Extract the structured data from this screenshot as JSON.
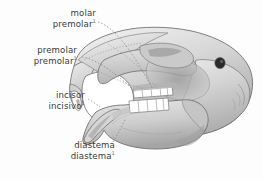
{
  "figure": {
    "background_color": "#fdfdfd",
    "text_color": "#3a3a3a",
    "leader_line_color": "#8a8a8a",
    "bone_fill_light": "#e6e6e6",
    "bone_fill_mid": "#cfcfcf",
    "bone_fill_dark": "#a8a8a8",
    "bone_outline": "#6b6b6b",
    "tooth_fill": "#ffffff",
    "foramen_fill": "#2b2b2b"
  },
  "labels": [
    {
      "id": "molar",
      "english": "molar",
      "spanish": "molar",
      "spanish_superscript": "1"
    },
    {
      "id": "premolar",
      "english": "premolar",
      "spanish": "premolar",
      "spanish_superscript": "1"
    },
    {
      "id": "incisor",
      "english": "incisor",
      "spanish": "incisivo",
      "spanish_superscript": "1"
    },
    {
      "id": "diastema",
      "english": "diastema",
      "spanish": "diastema",
      "spanish_superscript": "1"
    }
  ]
}
